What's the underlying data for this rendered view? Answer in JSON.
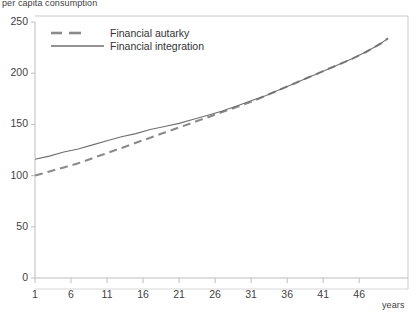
{
  "chart_data": {
    "type": "line",
    "title": "",
    "ylabel": "per capita consumption",
    "xlabel": "years",
    "xlim": [
      1,
      50
    ],
    "ylim": [
      0,
      250
    ],
    "grid": false,
    "legend_position": "top-left-inside",
    "yticks": [
      0,
      50,
      100,
      150,
      200,
      250
    ],
    "xticks": [
      1,
      6,
      11,
      16,
      21,
      26,
      31,
      36,
      41,
      46
    ],
    "series": [
      {
        "name": "Financial autarky",
        "style": "dashed",
        "color": "#8a8a8a",
        "x": [
          1,
          3,
          5,
          7,
          9,
          11,
          13,
          15,
          17,
          19,
          21,
          23,
          25,
          27,
          29,
          31,
          33,
          35,
          37,
          39,
          41,
          43,
          45,
          47,
          49,
          50
        ],
        "values": [
          100,
          104,
          108,
          112,
          117,
          122,
          127,
          132,
          137,
          142,
          147,
          152,
          157,
          162,
          167,
          172,
          178,
          184,
          190,
          196,
          202,
          208,
          214,
          221,
          229,
          234
        ]
      },
      {
        "name": "Financial integration",
        "style": "solid",
        "color": "#6f6f6f",
        "x": [
          1,
          3,
          5,
          7,
          9,
          11,
          13,
          15,
          17,
          19,
          21,
          23,
          25,
          27,
          29,
          31,
          33,
          35,
          37,
          39,
          41,
          43,
          45,
          47,
          49,
          50
        ],
        "values": [
          116,
          119,
          123,
          126,
          130,
          134,
          138,
          141,
          145,
          148,
          151,
          155,
          159,
          163,
          168,
          173,
          178,
          184,
          190,
          196,
          202,
          208,
          214,
          221,
          229,
          234
        ]
      }
    ]
  },
  "legend": {
    "items": [
      {
        "label": "Financial autarky",
        "style": "dashed"
      },
      {
        "label": "Financial integration",
        "style": "solid"
      }
    ]
  },
  "axis": {
    "ylabel_text": "per capita consumption",
    "xlabel_text": "years"
  },
  "colors": {
    "axis": "#bdbdbd",
    "border": "#c8c8c8",
    "text": "#3f3f3f",
    "series_autarky": "#8a8a8a",
    "series_integration": "#6f6f6f"
  }
}
